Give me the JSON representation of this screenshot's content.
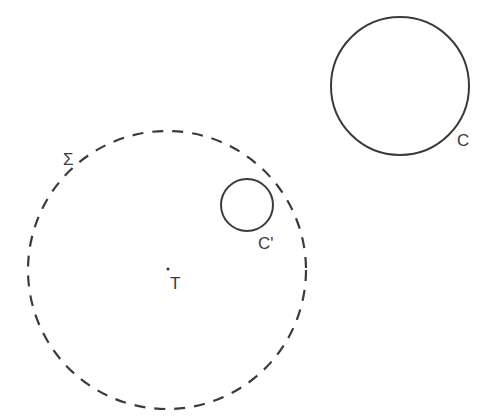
{
  "diagram": {
    "background": "#ffffff",
    "stroke_color": "#3a3a3a",
    "shapes": {
      "sigma_circle": {
        "cx": 167,
        "cy": 270,
        "r": 139,
        "style": "dashed"
      },
      "circle_c": {
        "cx": 400,
        "cy": 86,
        "r": 69,
        "style": "solid"
      },
      "circle_c_prime": {
        "cx": 247,
        "cy": 205,
        "r": 26,
        "style": "solid"
      },
      "point_t": {
        "cx": 168,
        "cy": 269
      }
    },
    "labels": {
      "sigma": "Σ",
      "c": "C",
      "c_prime": "C'",
      "t": "T"
    }
  }
}
